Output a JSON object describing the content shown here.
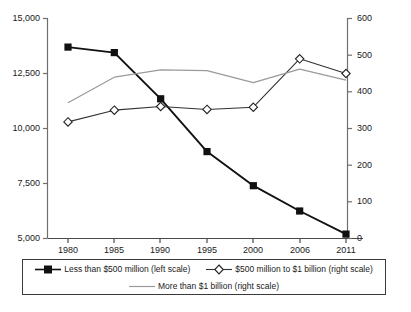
{
  "chart_data": {
    "type": "line",
    "title": "",
    "xlabel": "",
    "ylabel": "",
    "grid": false,
    "legend_position": "bottom",
    "x": [
      "1980",
      "1985",
      "1990",
      "1995",
      "2000",
      "2006",
      "2011"
    ],
    "categories": [
      "1980",
      "1985",
      "1990",
      "1995",
      "2000",
      "2006",
      "2011"
    ],
    "axes": {
      "left": {
        "label": "",
        "ylim": [
          5000,
          15000
        ],
        "ticks": [
          5000,
          7500,
          10000,
          12500,
          15000
        ],
        "tick_labels": [
          "5,000",
          "7,500",
          "10,000",
          "12,500",
          "15,000"
        ]
      },
      "right": {
        "label": "",
        "ylim": [
          0,
          600
        ],
        "ticks": [
          0,
          100,
          200,
          300,
          400,
          500,
          600
        ],
        "tick_labels": [
          "0",
          "100",
          "200",
          "300",
          "400",
          "500",
          "600"
        ]
      },
      "x": {
        "tick_labels": [
          "1980",
          "1985",
          "1990",
          "1995",
          "2000",
          "2006",
          "2011"
        ]
      }
    },
    "series": [
      {
        "name": "Less than $500 million (left scale)",
        "axis": "left",
        "marker": "filled-square",
        "color": "#111111",
        "values": [
          13700,
          13450,
          11350,
          8950,
          7400,
          6250,
          5200
        ]
      },
      {
        "name": "$500 million to $1 billion (right scale)",
        "axis": "right",
        "marker": "open-diamond",
        "color": "#333333",
        "values": [
          318,
          350,
          360,
          352,
          358,
          490,
          450
        ]
      },
      {
        "name": "More than $1 billion (right scale)",
        "axis": "right",
        "marker": "none",
        "color": "#9a9a9a",
        "values": [
          370,
          440,
          460,
          458,
          425,
          462,
          432
        ]
      }
    ]
  },
  "legend": {
    "entries": [
      {
        "label": "Less than $500 million (left scale)",
        "key": "filled-square-line"
      },
      {
        "label": "$500 million to $1 billion (right scale)",
        "key": "open-diamond-line"
      },
      {
        "label": "More than $1 billion (right scale)",
        "key": "plain-gray-line"
      }
    ]
  },
  "caption": {
    "text": ""
  }
}
